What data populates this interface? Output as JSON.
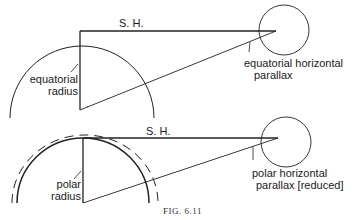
{
  "figure": {
    "caption": "FIG. 6.11",
    "top_diagram": {
      "sh_label": "S. H.",
      "radius_label_line1": "equatorial",
      "radius_label_line2": "radius",
      "parallax_label_line1": "equatorial horizontal",
      "parallax_label_line2": "parallax"
    },
    "bottom_diagram": {
      "sh_label": "S. H.",
      "radius_label_line1": "polar",
      "radius_label_line2": "radius",
      "parallax_label_line1": "polar horizontal",
      "parallax_label_line2": "parallax [reduced]"
    },
    "colors": {
      "line": "#222222",
      "background": "#ffffff"
    }
  }
}
